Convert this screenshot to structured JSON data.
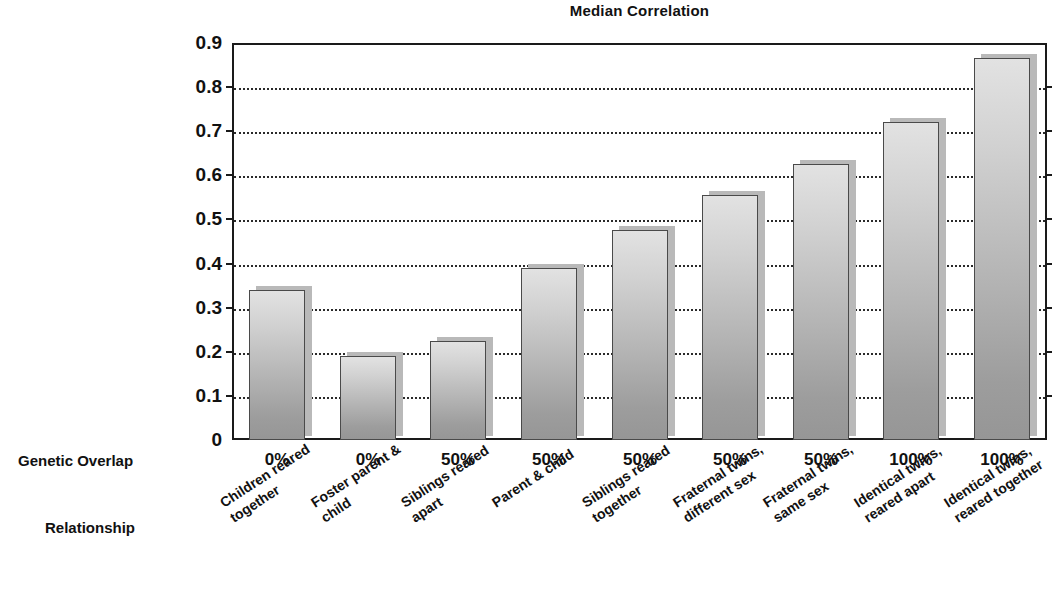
{
  "chart_data": {
    "type": "bar",
    "title": "Median Correlation",
    "xlabel": "",
    "ylabel": "",
    "ylim": [
      0,
      0.9
    ],
    "grid": true,
    "legend": null,
    "categories": [
      "Children reared together",
      "Foster parent & child",
      "Siblings reared apart",
      "Parent & child",
      "Siblings reared together",
      "Fraternal twins, different sex",
      "Fraternal twins, same sex",
      "Identical twins, reared apart",
      "Identical twins, reared together"
    ],
    "values": [
      0.34,
      0.19,
      0.225,
      0.39,
      0.475,
      0.555,
      0.625,
      0.72,
      0.865
    ],
    "ytick_labels": [
      "0.9",
      "0.8",
      "0.7",
      "0.6",
      "0.5",
      "0.4",
      "0.3",
      "0.2",
      "0.1",
      "0"
    ],
    "ytick_values": [
      0.9,
      0.8,
      0.7,
      0.6,
      0.5,
      0.4,
      0.3,
      0.2,
      0.1,
      0
    ],
    "row_headers": {
      "genetic_overlap": "Genetic Overlap",
      "relationship": "Relationship"
    },
    "genetic_overlap": [
      "0%",
      "0%",
      "50%",
      "50%",
      "50%",
      "50%",
      "50%",
      "100%",
      "100%"
    ],
    "category_lines": [
      [
        "Children reared",
        "together"
      ],
      [
        "Foster parent &",
        "child"
      ],
      [
        "Siblings reared",
        "apart"
      ],
      [
        "Parent & child",
        ""
      ],
      [
        "Siblings reared",
        "together"
      ],
      [
        "Fraternal twins,",
        "different sex"
      ],
      [
        "Fraternal twins,",
        "same sex"
      ],
      [
        "Identical twins,",
        "reared apart"
      ],
      [
        "Identical twins,",
        "reared together"
      ]
    ],
    "colors": {
      "bar_top": "#e2e2e2",
      "bar_bottom": "#969696",
      "bar_border": "#4a4a4a",
      "shadow": "#b9b9b9",
      "axis": "#1a1a1a",
      "gridline": "#2a2a2a",
      "text": "#111111",
      "background": "#ffffff"
    }
  }
}
